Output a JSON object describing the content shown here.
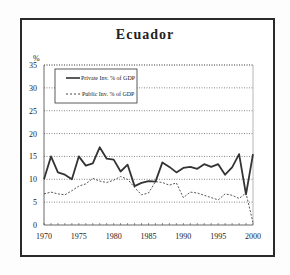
{
  "chart_data": {
    "type": "line",
    "title": "Ecuador",
    "xlabel": "",
    "ylabel": "%",
    "ylim": [
      0,
      35
    ],
    "xlim": [
      1970,
      2000
    ],
    "grid": "horizontal dotted",
    "legend_position": "upper left",
    "yticks": [
      "0",
      "5",
      "10",
      "15",
      "20",
      "25",
      "30",
      "35"
    ],
    "xticks": [
      "1970",
      "1975",
      "1980",
      "1985",
      "1990",
      "1995",
      "2000"
    ],
    "x": [
      1970,
      1971,
      1972,
      1973,
      1974,
      1975,
      1976,
      1977,
      1978,
      1979,
      1980,
      1981,
      1982,
      1983,
      1984,
      1985,
      1986,
      1987,
      1988,
      1989,
      1990,
      1991,
      1992,
      1993,
      1994,
      1995,
      1996,
      1997,
      1998,
      1999,
      2000
    ],
    "series": [
      {
        "name": "Private Inv. % of GDP",
        "style": "solid",
        "values": [
          10.0,
          15.0,
          11.5,
          11.0,
          10.0,
          15.0,
          13.0,
          13.5,
          17.0,
          14.5,
          14.3,
          11.7,
          13.2,
          8.5,
          9.2,
          9.6,
          9.5,
          13.7,
          12.7,
          11.5,
          12.5,
          12.7,
          12.3,
          13.3,
          12.7,
          13.3,
          11.0,
          12.6,
          15.5,
          6.7,
          15.5
        ]
      },
      {
        "name": "Public Inv. % of GDP",
        "style": "dashed",
        "values": [
          6.8,
          7.2,
          6.8,
          6.6,
          7.5,
          8.5,
          9.0,
          10.2,
          9.6,
          9.3,
          9.8,
          10.6,
          10.0,
          8.2,
          6.6,
          7.0,
          9.5,
          9.3,
          8.7,
          9.2,
          6.0,
          7.2,
          7.0,
          6.5,
          6.0,
          5.5,
          6.8,
          6.5,
          5.8,
          7.0,
          0.5
        ]
      }
    ]
  }
}
